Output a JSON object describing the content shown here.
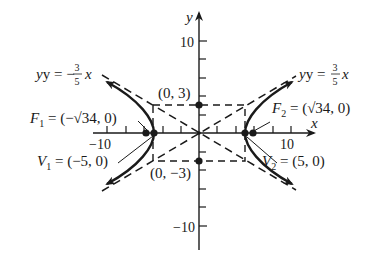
{
  "diagram": {
    "type": "hyperbola",
    "equation": "x^2/25 - y^2/9 = 1",
    "axes": {
      "x_label": "x",
      "y_label": "y",
      "x_ticks": {
        "neg": "−10",
        "pos": "10"
      },
      "y_ticks": {
        "pos": "10",
        "neg": "−10"
      },
      "range": {
        "x": [
          -11.5,
          12.5
        ],
        "y": [
          -12.5,
          13
        ]
      }
    },
    "asymptotes": [
      {
        "label_lhs": "y = −",
        "num": "3",
        "den": "5",
        "var": "x",
        "slope": -0.6
      },
      {
        "label_lhs": "y = ",
        "num": "3",
        "den": "5",
        "var": "x",
        "slope": 0.6
      }
    ],
    "points": {
      "co_vertex_top": {
        "label": "(0, 3)",
        "x": 0,
        "y": 3
      },
      "co_vertex_bottom": {
        "label": "(0, −3)",
        "x": 0,
        "y": -3
      },
      "focus_1": {
        "name": "F",
        "sub": "1",
        "value": " = (−√34, 0)",
        "x": -5.831,
        "y": 0
      },
      "focus_2": {
        "name": "F",
        "sub": "2",
        "value": " = (√34, 0)",
        "x": 5.831,
        "y": 0
      },
      "vertex_1": {
        "name": "V",
        "sub": "1",
        "value": " = (−5, 0)",
        "x": -5,
        "y": 0
      },
      "vertex_2": {
        "name": "V",
        "sub": "2",
        "value": " = (5, 0)",
        "x": 5,
        "y": 0
      }
    },
    "central_box": {
      "x": [
        -5,
        5
      ],
      "y": [
        -3,
        3
      ]
    },
    "colors": {
      "ink": "#1a1a1a",
      "background": "#ffffff"
    }
  }
}
